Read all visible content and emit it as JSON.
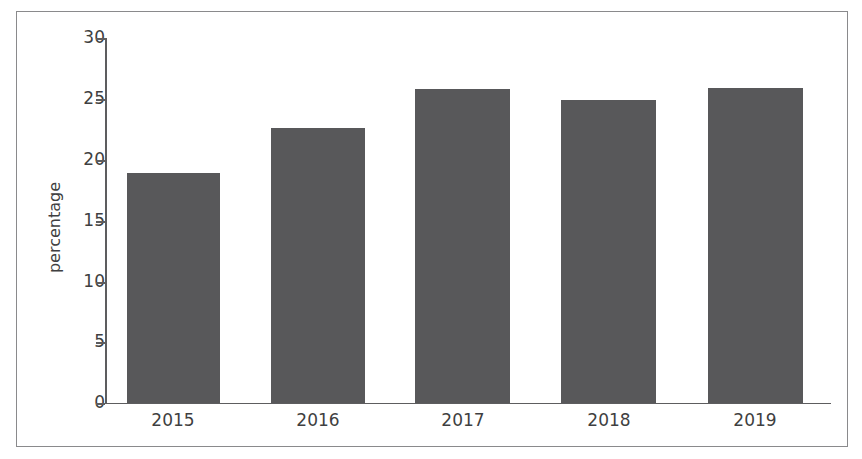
{
  "chart_data": {
    "type": "bar",
    "title": "",
    "subtitle": "",
    "xlabel": "",
    "ylabel": "percentage",
    "categories": [
      "2015",
      "2016",
      "2017",
      "2018",
      "2019"
    ],
    "values": [
      18.9,
      22.6,
      25.8,
      24.9,
      25.9
    ],
    "series": [
      {
        "name": "percentage",
        "values": [
          18.9,
          22.6,
          25.8,
          24.9,
          25.9
        ]
      }
    ],
    "ylim": [
      0,
      30
    ],
    "y_ticks": [
      0,
      5,
      10,
      15,
      20,
      25,
      30
    ],
    "y_tick_labels": [
      "0",
      "5",
      "10",
      "15",
      "20",
      "25",
      "30"
    ],
    "grid": false,
    "legend": false,
    "legend_position": "none",
    "annotations": [],
    "bar_color": "#58585a",
    "axis_color": "#5d5d5f",
    "text_color": "#3f3f41",
    "background_color": "#ffffff",
    "border_color": "#8a8a8c"
  }
}
